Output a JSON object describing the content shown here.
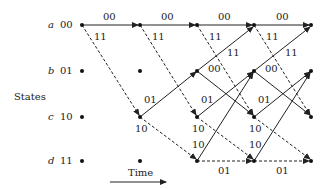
{
  "axis": {
    "states_label": "States",
    "time_label": "Time"
  },
  "states": [
    {
      "letter": "a",
      "code": "00"
    },
    {
      "letter": "b",
      "code": "01"
    },
    {
      "letter": "c",
      "code": "10"
    },
    {
      "letter": "d",
      "code": "11"
    }
  ],
  "legend": {
    "solid": "input 0",
    "dashed": "input 1"
  },
  "edge_labels": {
    "aa": "00",
    "ac": "11",
    "ca": "11",
    "cb": "00",
    "bc": "01",
    "bd": "10",
    "db": "10",
    "dd": "01"
  },
  "colors": {
    "line": "#222222",
    "background": "#ffffff"
  }
}
